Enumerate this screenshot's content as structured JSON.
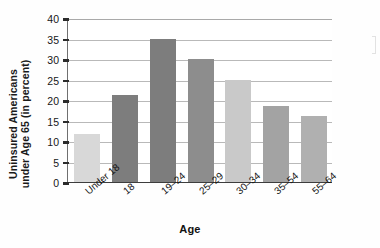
{
  "chart_data": {
    "type": "bar",
    "title": "",
    "xlabel": "Age",
    "ylabel": "Uninsured Americans under Age 65 (in percent)",
    "ylabel_line1": "Uninsured Americans",
    "ylabel_line2": "under Age 65 (in percent)",
    "categories": [
      "Under 18",
      "18",
      "19–24",
      "25–29",
      "30–34",
      "35–54",
      "55–64"
    ],
    "values": [
      11.8,
      21.2,
      35.0,
      30.0,
      25.0,
      18.5,
      16.0
    ],
    "bar_colors": [
      "#d8d8d8",
      "#7d7d7d",
      "#7d7d7d",
      "#8d8d8d",
      "#c9c9c9",
      "#a3a3a3",
      "#b0b0b0"
    ],
    "ylim": [
      0,
      40
    ],
    "yticks": [
      0,
      5,
      10,
      15,
      20,
      25,
      30,
      35,
      40
    ],
    "ytick_labels": [
      "0",
      "5",
      "10",
      "15",
      "20",
      "25",
      "30",
      "35",
      "40"
    ],
    "grid": true,
    "grid_axis": "y",
    "legend": null,
    "legend_position": "none",
    "background": "#ffffff",
    "axis_color": "#3d3d3d",
    "grid_color": "#b9b9b9"
  }
}
